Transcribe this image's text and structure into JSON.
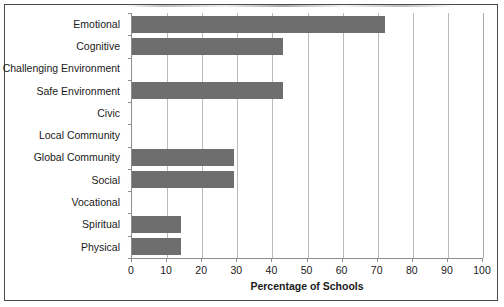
{
  "chart_data": {
    "type": "bar",
    "orientation": "horizontal",
    "title": "",
    "xlabel": "Percentage of Schools",
    "ylabel": "",
    "xlim": [
      0,
      100
    ],
    "xticks": [
      0,
      10,
      20,
      30,
      40,
      50,
      60,
      70,
      80,
      90,
      100
    ],
    "grid": "vertical",
    "legend": "none",
    "bar_color": "#6e6e6e",
    "categories": [
      "Emotional",
      "Cognitive",
      "Challenging Environment",
      "Safe Environment",
      "Civic",
      "Local Community",
      "Global Community",
      "Social",
      "Vocational",
      "Spiritual",
      "Physical"
    ],
    "values": [
      72,
      43,
      0,
      43,
      0,
      0,
      29,
      29,
      0,
      14,
      14
    ]
  },
  "axis": {
    "x_title": "Percentage of Schools"
  }
}
